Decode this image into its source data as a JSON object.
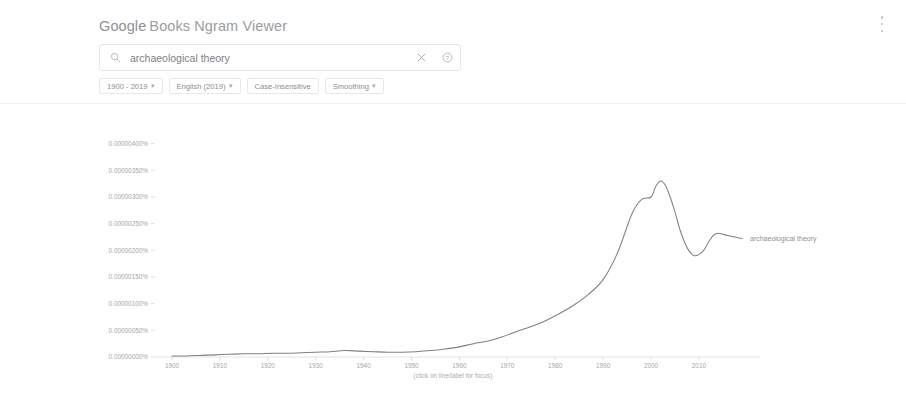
{
  "header": {
    "brand_google": "Google",
    "brand_rest": "Books Ngram Viewer",
    "menu_icon": "kebab-menu-icon"
  },
  "search": {
    "value": "archaeological theory",
    "placeholder": "",
    "search_icon": "search-icon",
    "clear_icon": "close-icon",
    "help_icon": "help-circle-icon"
  },
  "filters": [
    {
      "label": "1900 - 2019",
      "caret": "▾"
    },
    {
      "label": "English (2019)",
      "caret": "▾"
    },
    {
      "label": "Case-Insensitive",
      "caret": ""
    },
    {
      "label": "Smoothing",
      "caret": "▾"
    }
  ],
  "chart_note": "(click on line/label for focus)",
  "chart_data": {
    "type": "line",
    "title": "",
    "xlabel": "",
    "ylabel": "",
    "grid": false,
    "legend_position": "right-inline",
    "xlim": [
      1900,
      2019
    ],
    "ylim": [
      0,
      4.5e-06
    ],
    "xticks": [
      1900,
      1910,
      1920,
      1930,
      1940,
      1950,
      1960,
      1970,
      1980,
      1990,
      2000,
      2010
    ],
    "xticklabels": [
      "1900",
      "1910",
      "1920",
      "1930",
      "1940",
      "1950",
      "1960",
      "1970",
      "1980",
      "1990",
      "2000",
      "2010"
    ],
    "yticks": [
      4e-06,
      3.5e-06,
      3e-06,
      2.5e-06,
      2e-06,
      1.5e-06,
      1e-06,
      5e-07,
      0.0
    ],
    "yticklabels": [
      "0.00000400%",
      "0.00000350%",
      "0.00000300%",
      "0.00000250%",
      "0.00000200%",
      "0.00000150%",
      "0.00000100%",
      "0.00000050%",
      "0.00000000%"
    ],
    "series": [
      {
        "name": "archaeological theory",
        "color": "#7d8086",
        "x": [
          1900,
          1903,
          1906,
          1909,
          1912,
          1915,
          1918,
          1921,
          1924,
          1927,
          1930,
          1933,
          1936,
          1939,
          1942,
          1945,
          1948,
          1951,
          1954,
          1957,
          1960,
          1963,
          1966,
          1969,
          1972,
          1975,
          1978,
          1981,
          1984,
          1987,
          1990,
          1993,
          1996,
          1998,
          2000,
          2001,
          2002,
          2003,
          2004,
          2005,
          2006,
          2007,
          2008,
          2009,
          2010,
          2011,
          2012,
          2013,
          2014,
          2015,
          2016,
          2017,
          2018,
          2019
        ],
        "y": [
          2e-08,
          2e-08,
          3e-08,
          4e-08,
          5e-08,
          6e-08,
          6e-08,
          7e-08,
          7e-08,
          8e-08,
          9e-08,
          1e-07,
          1.2e-07,
          1.1e-07,
          1e-07,
          9e-08,
          9e-08,
          1e-07,
          1.2e-07,
          1.5e-07,
          1.9e-07,
          2.5e-07,
          3e-07,
          3.8e-07,
          4.8e-07,
          5.7e-07,
          6.8e-07,
          8.2e-07,
          9.8e-07,
          1.18e-06,
          1.45e-06,
          1.95e-06,
          2.68e-06,
          2.95e-06,
          3e-06,
          3.2e-06,
          3.3e-06,
          3.22e-06,
          3e-06,
          2.72e-06,
          2.4e-06,
          2.15e-06,
          1.98e-06,
          1.9e-06,
          1.92e-06,
          2e-06,
          2.15e-06,
          2.28e-06,
          2.32e-06,
          2.3e-06,
          2.28e-06,
          2.26e-06,
          2.24e-06,
          2.22e-06
        ]
      }
    ]
  }
}
